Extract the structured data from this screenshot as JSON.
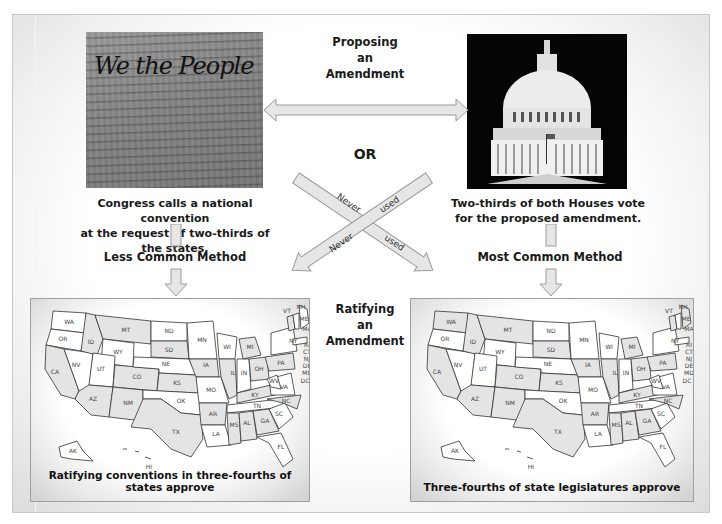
{
  "diagram": {
    "type": "amendment-process-flowchart",
    "proposing": {
      "heading_lines": [
        "Proposing",
        "an",
        "Amendment"
      ],
      "or_label": "OR",
      "left": {
        "image": "we-the-people-constitution-photo",
        "image_script_text": "We the People",
        "caption_lines": [
          "Congress calls a national convention",
          "at the request of two-thirds of the states."
        ],
        "method_label": "Less Common Method"
      },
      "right": {
        "image": "us-capitol-dome-photo",
        "caption_lines": [
          "Two-thirds of both Houses vote",
          "for the proposed amendment."
        ],
        "method_label": "Most Common Method"
      }
    },
    "cross_arrows": {
      "arrow1_words": [
        "Never",
        "used"
      ],
      "arrow2_words": [
        "Never",
        "used"
      ]
    },
    "ratifying": {
      "heading_lines": [
        "Ratifying",
        "an",
        "Amendment"
      ],
      "left_map": {
        "caption": "Ratifying conventions in three-fourths of states approve"
      },
      "right_map": {
        "caption": "Three-fourths of state legislatures approve"
      }
    },
    "map_states": [
      "WA",
      "OR",
      "CA",
      "NV",
      "ID",
      "MT",
      "WY",
      "UT",
      "AZ",
      "CO",
      "NM",
      "ND",
      "SD",
      "NE",
      "KS",
      "OK",
      "TX",
      "MN",
      "IA",
      "MO",
      "AR",
      "LA",
      "WI",
      "IL",
      "MI",
      "IN",
      "OH",
      "KY",
      "TN",
      "MS",
      "AL",
      "GA",
      "FL",
      "SC",
      "NC",
      "VA",
      "WV",
      "PA",
      "NY",
      "VT",
      "NH",
      "ME",
      "MA",
      "RI",
      "CT",
      "NJ",
      "DE",
      "MD",
      "DC",
      "AK",
      "HI"
    ],
    "colors": {
      "arrow_fill": "#e6e6e6",
      "arrow_stroke": "#9a9a9a",
      "shaded_state": "#e4e4e4",
      "text": "#1a1a1a"
    }
  }
}
